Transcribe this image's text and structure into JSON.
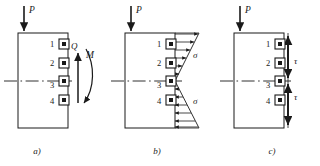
{
  "figure": {
    "title": "",
    "panels": [
      {
        "id": "a",
        "caption": "a)",
        "load_label": "P",
        "element_numbers": [
          "1",
          "2",
          "3",
          "4"
        ],
        "stress_labels": [
          {
            "name": "shear-force",
            "text": "Q"
          },
          {
            "name": "bending-moment",
            "text": "M"
          }
        ],
        "description": "cross-section with resultant shear force Q and bending moment M"
      },
      {
        "id": "b",
        "caption": "b)",
        "load_label": "P",
        "element_numbers": [
          "1",
          "2",
          "3",
          "4"
        ],
        "stress_labels": [
          {
            "name": "normal-stress-top",
            "text": "σ"
          },
          {
            "name": "normal-stress-bottom",
            "text": "σ"
          }
        ],
        "description": "triangular bending normal stress distribution sigma"
      },
      {
        "id": "c",
        "caption": "c)",
        "load_label": "P",
        "element_numbers": [
          "1",
          "2",
          "3",
          "4"
        ],
        "stress_labels": [
          {
            "name": "shear-stress-upper",
            "text": "τ"
          },
          {
            "name": "shear-stress-lower",
            "text": "τ"
          }
        ],
        "description": "shear stress tau distribution with vertical arrows"
      }
    ]
  },
  "colors": {
    "line": "#1a1a1a",
    "text": "#1a1a1a",
    "background": "#ffffff"
  }
}
